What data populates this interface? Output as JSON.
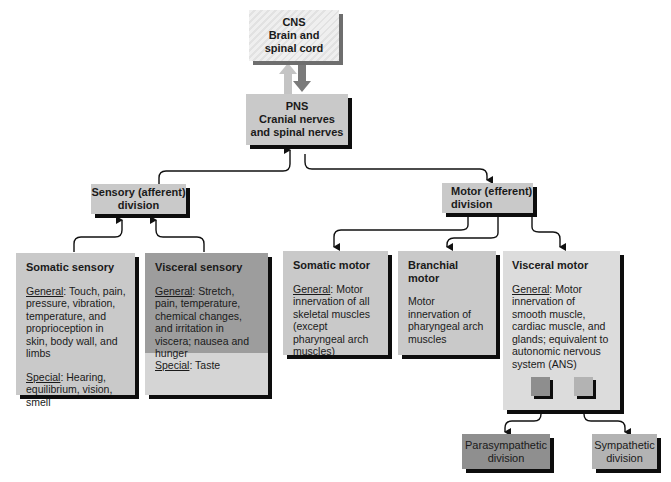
{
  "cns": {
    "line1": "CNS",
    "line2": "Brain and",
    "line3": "spinal cord"
  },
  "pns": {
    "line1": "PNS",
    "line2": "Cranial nerves",
    "line3": "and spinal nerves"
  },
  "sensory_division": {
    "line1": "Sensory (afferent)",
    "line2": "division"
  },
  "motor_division": {
    "line1": "Motor (efferent)",
    "line2": "division"
  },
  "somatic_sensory": {
    "title": "Somatic sensory",
    "general_label": "General",
    "general_text": ": Touch, pain, pressure, vibration, temperature, and proprioception in skin, body wall, and limbs",
    "special_label": "Special",
    "special_text": ": Hearing, equilibrium, vision, smell"
  },
  "visceral_sensory": {
    "title": "Visceral sensory",
    "general_label": "General",
    "general_text": ": Stretch, pain, temperature, chemical changes, and irritation in viscera; nausea and hunger",
    "special_label": "Special",
    "special_text": ": Taste"
  },
  "somatic_motor": {
    "title": "Somatic motor",
    "general_label": "General",
    "general_text": ": Motor innervation of all skeletal muscles (except pharyngeal arch muscles)"
  },
  "branchial_motor": {
    "title": "Branchial motor",
    "text": "Motor innervation of pharyngeal arch muscles"
  },
  "visceral_motor": {
    "title": "Visceral motor",
    "general_label": "General",
    "general_text": ": Motor innervation of smooth muscle, cardiac muscle, and glands; equivalent to autonomic nervous system (ANS)"
  },
  "parasympathetic": {
    "line1": "Parasympathetic",
    "line2": "division"
  },
  "sympathetic": {
    "line1": "Sympathetic",
    "line2": "division"
  },
  "colors": {
    "box_gray": "#c9c9c9",
    "dark_gray": "#9b9b9b",
    "light_gray": "#dcdcdc",
    "shadow": "#0d0d0d",
    "arrow_up": "#c4c4c4",
    "arrow_down": "#7a7a7a"
  }
}
